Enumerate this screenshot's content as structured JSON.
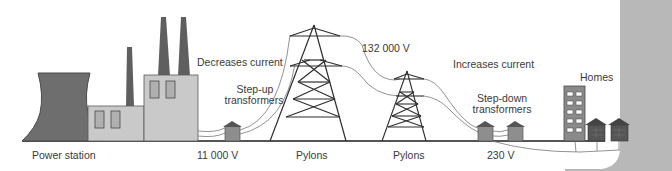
{
  "diagram": {
    "labels": {
      "power_station": "Power station",
      "voltage_generation": "11 000 V",
      "decreases_current": "Decreases current",
      "step_up": [
        "Step-up",
        "transformers"
      ],
      "voltage_transmission": "132 000 V",
      "pylons_1": "Pylons",
      "pylons_2": "Pylons",
      "increases_current": "Increases current",
      "step_down": [
        "Step-down",
        "transformers"
      ],
      "voltage_domestic": "230 V",
      "homes": "Homes"
    },
    "colors": {
      "dark_grey": "#6b6b6b",
      "mid_grey": "#8e8e8e",
      "light_grey": "#c9c9c9",
      "outline": "#3f3f3f",
      "ground": "#555555",
      "edge_panel": "#b8b8b8",
      "text": "#3a3a3a"
    }
  }
}
